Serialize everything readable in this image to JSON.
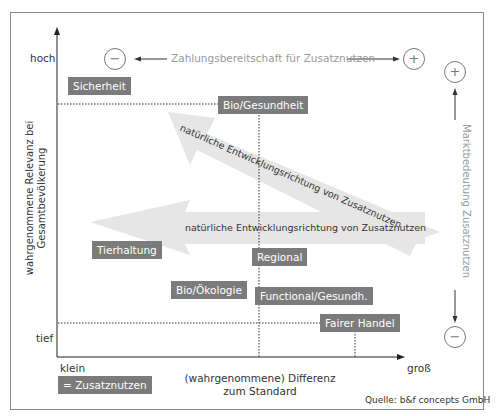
{
  "diagram": {
    "y_axis": {
      "title_line1": "wahrgenommene Relevanz bei",
      "title_line2": "Gesamtbevölkerung",
      "high": "hoch",
      "low": "tief"
    },
    "x_axis": {
      "title_line1": "(wahrgenommene) Differenz",
      "title_line2": "zum Standard",
      "low": "klein",
      "high": "groß"
    },
    "top_scale": {
      "label": "Zahlungsbereitschaft für Zusatznutzen",
      "left_symbol": "−",
      "right_symbol": "+"
    },
    "right_scale": {
      "label": "Marktbedeutung Zusatznutzen",
      "top_symbol": "+",
      "bottom_symbol": "−"
    },
    "items": [
      {
        "label": "Sicherheit"
      },
      {
        "label": "Bio/Gesundheit"
      },
      {
        "label": "Tierhaltung"
      },
      {
        "label": "Regional"
      },
      {
        "label": "Bio/Ökologie"
      },
      {
        "label": "Functional/Gesundh."
      },
      {
        "label": "Fairer Handel"
      }
    ],
    "arrows": {
      "diagonal": "natürliche Entwicklungsrichtung von Zusatznutzen",
      "horizontal": "natürliche Entwicklungsrichtung von Zusatznutzen"
    },
    "legend": "= Zusatznutzen",
    "source": "Quelle: b&f concepts GmbH",
    "colors": {
      "box": "#7b7b7b",
      "arrow": "#e6e6e6",
      "axis": "#222222",
      "scale_text": "#9a9a9a"
    }
  }
}
